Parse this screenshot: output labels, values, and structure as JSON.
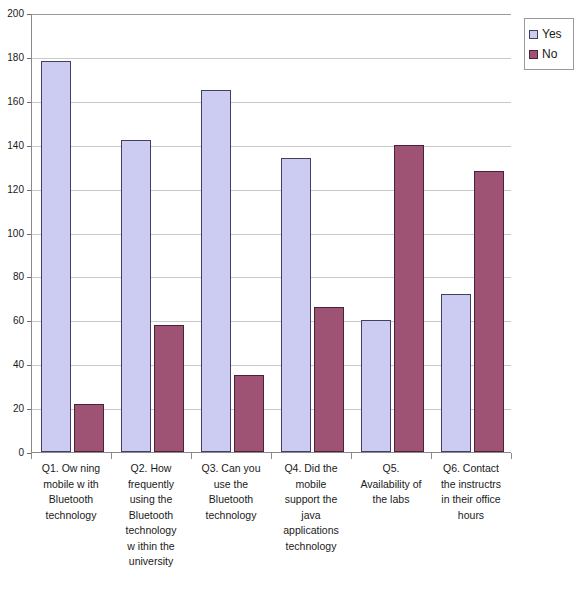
{
  "chart_data": {
    "type": "bar",
    "title": "",
    "subtitle": "",
    "xlabel": "",
    "ylabel": "",
    "ylim": [
      0,
      200
    ],
    "yticks": [
      0,
      20,
      40,
      60,
      80,
      100,
      120,
      140,
      160,
      180,
      200
    ],
    "grid": true,
    "legend_position": "top-right",
    "categories": [
      "Q1. Ow ning mobile w ith Bluetooth technology",
      "Q2. How frequently using the Bluetooth technology w ithin the university",
      "Q3. Can you use the Bluetooth technology",
      "Q4. Did the mobile support the java applications technology",
      "Q5. Availability of the labs",
      "Q6. Contact the instructrs in their office hours"
    ],
    "category_lines": [
      [
        "Q1. Ow ning",
        "mobile w ith",
        "Bluetooth",
        "technology"
      ],
      [
        "Q2. How",
        "frequently",
        "using the",
        "Bluetooth",
        "technology",
        "w ithin the",
        "university"
      ],
      [
        "Q3. Can you",
        "use the",
        "Bluetooth",
        "technology"
      ],
      [
        "Q4. Did the",
        "mobile",
        "support the",
        "java",
        "applications",
        "technology"
      ],
      [
        "Q5.",
        "Availability of",
        "the labs"
      ],
      [
        "Q6. Contact",
        "the instructrs",
        "in their office",
        "hours"
      ]
    ],
    "series": [
      {
        "name": "Yes",
        "color": "#ccccf2",
        "values": [
          178,
          142,
          165,
          134,
          60,
          72
        ]
      },
      {
        "name": "No",
        "color": "#9e5274",
        "values": [
          22,
          58,
          35,
          66,
          140,
          128
        ]
      }
    ]
  },
  "legend": {
    "items": [
      {
        "label": "Yes",
        "swatch": "legend-swatch-yes"
      },
      {
        "label": "No",
        "swatch": "legend-swatch-no"
      }
    ]
  },
  "axis": {
    "y_tick_labels": [
      "200",
      "180",
      "160",
      "140",
      "120",
      "100",
      "80",
      "60",
      "40",
      "20",
      "0"
    ]
  }
}
